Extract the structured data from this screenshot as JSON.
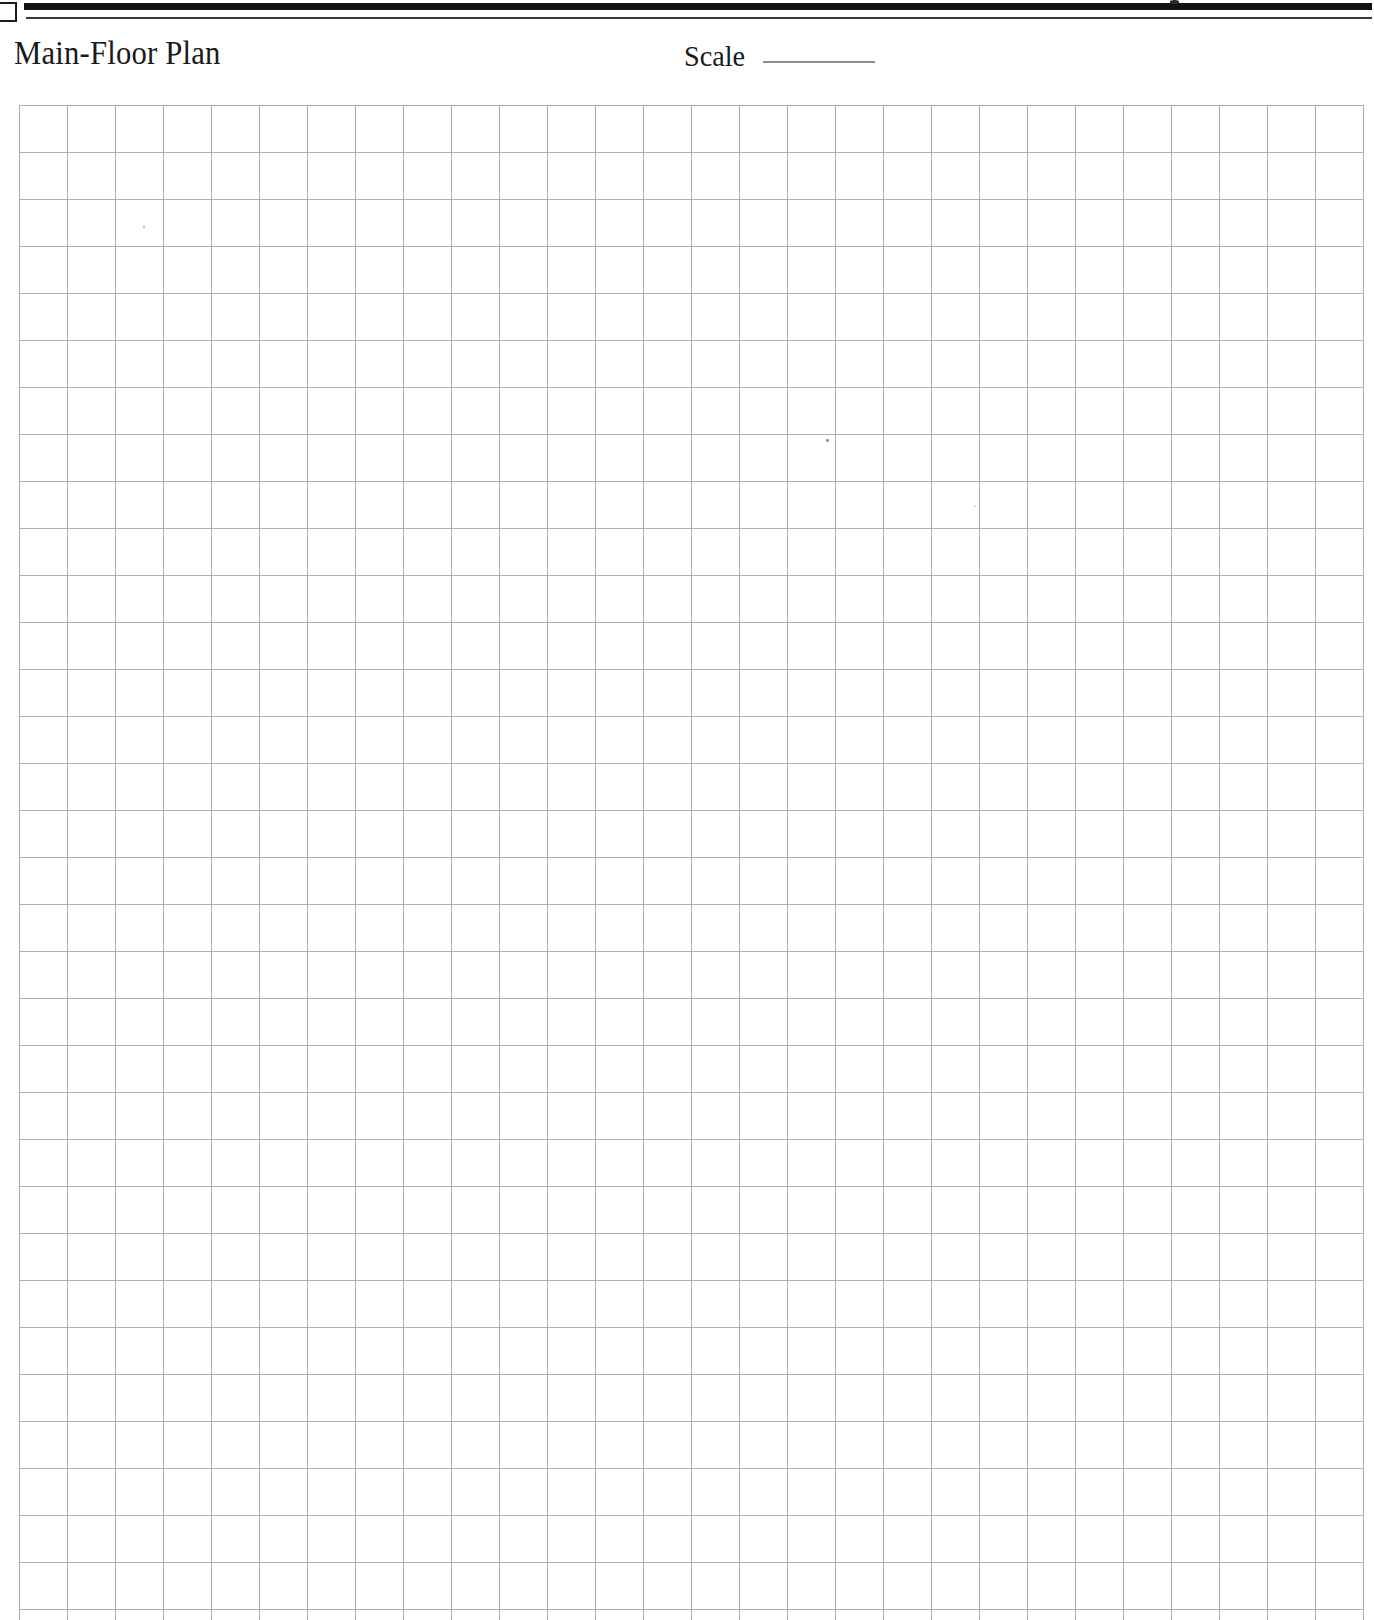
{
  "document": {
    "kind": "blank-graph-paper-worksheet",
    "title": "Main-Floor Plan",
    "paper_color": "#ffffff"
  },
  "header": {
    "title": "Main-Floor Plan",
    "rules": {
      "thick_rule_color": "#121212",
      "thin_rule_color": "#3a3a3a"
    },
    "crop_mark": {
      "name": "corner-crop-mark",
      "color": "#1b1b1b"
    }
  },
  "scale_field": {
    "label": "Scale",
    "value": "",
    "placeholder": "",
    "blank_line_color": "#8d8d8d"
  },
  "grid": {
    "name": "graph-paper-grid",
    "columns": 28,
    "rows": 32,
    "cell_width_px": 48,
    "cell_height_px": 47,
    "line_color": "#adadad",
    "origin_x_px": 19,
    "origin_y_px": 105,
    "width_px": 1345,
    "height_px": 1515,
    "content": ""
  },
  "artifacts": {
    "top_edge_mark": "scan-speck",
    "grid_specks": 4
  }
}
